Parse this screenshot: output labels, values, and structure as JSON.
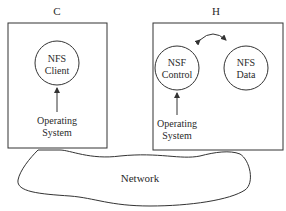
{
  "diagram": {
    "hosts": [
      {
        "label": "C",
        "components": [
          {
            "line1": "NFS",
            "line2": "Client"
          }
        ],
        "os": {
          "line1": "Operating",
          "line2": "System"
        }
      },
      {
        "label": "H",
        "components": [
          {
            "line1": "NSF",
            "line2": "Control"
          },
          {
            "line1": "NFS",
            "line2": "Data"
          }
        ],
        "os": {
          "line1": "Operating",
          "line2": "System"
        }
      }
    ],
    "network": {
      "label": "Network"
    },
    "colors": {
      "stroke": "#333333",
      "text": "#2a2a2a",
      "background": "#ffffff"
    }
  }
}
